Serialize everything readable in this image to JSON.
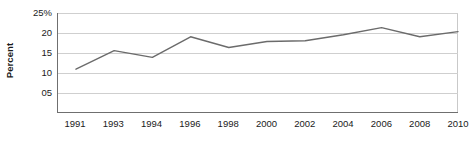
{
  "chart_data": {
    "type": "line",
    "title": "",
    "xlabel": "",
    "ylabel": "Percent",
    "categories": [
      "1991",
      "1993",
      "1994",
      "1996",
      "1998",
      "2000",
      "2002",
      "2004",
      "2006",
      "2008",
      "2010"
    ],
    "values": [
      10.8,
      15.5,
      13.8,
      19.0,
      16.3,
      17.8,
      18.0,
      19.5,
      21.3,
      19.0,
      20.3
    ],
    "series": [
      {
        "name": "Percent",
        "values": [
          10.8,
          15.5,
          13.8,
          19.0,
          16.3,
          17.8,
          18.0,
          19.5,
          21.3,
          19.0,
          20.3
        ]
      }
    ],
    "ylim": [
      0,
      25
    ],
    "xlim": [
      1991,
      2010
    ],
    "ytick_labels": [
      "25%",
      "20",
      "15",
      "10",
      "05"
    ],
    "ytick_values": [
      25,
      20,
      15,
      10,
      5
    ],
    "xtick_labels": [
      "1991",
      "1993",
      "1994",
      "1996",
      "1998",
      "2000",
      "2002",
      "2004",
      "2006",
      "2008",
      "2010"
    ],
    "grid": true,
    "grid_axis": "y",
    "legend": false,
    "legend_position": "none",
    "line_color": "#6b6b6b",
    "grid_color": "#cfcfcf",
    "axis_color": "#6f6f6f",
    "text_color": "#1a1a1a",
    "background_color": "#ffffff"
  },
  "axis": {
    "y_title": "Percent"
  }
}
